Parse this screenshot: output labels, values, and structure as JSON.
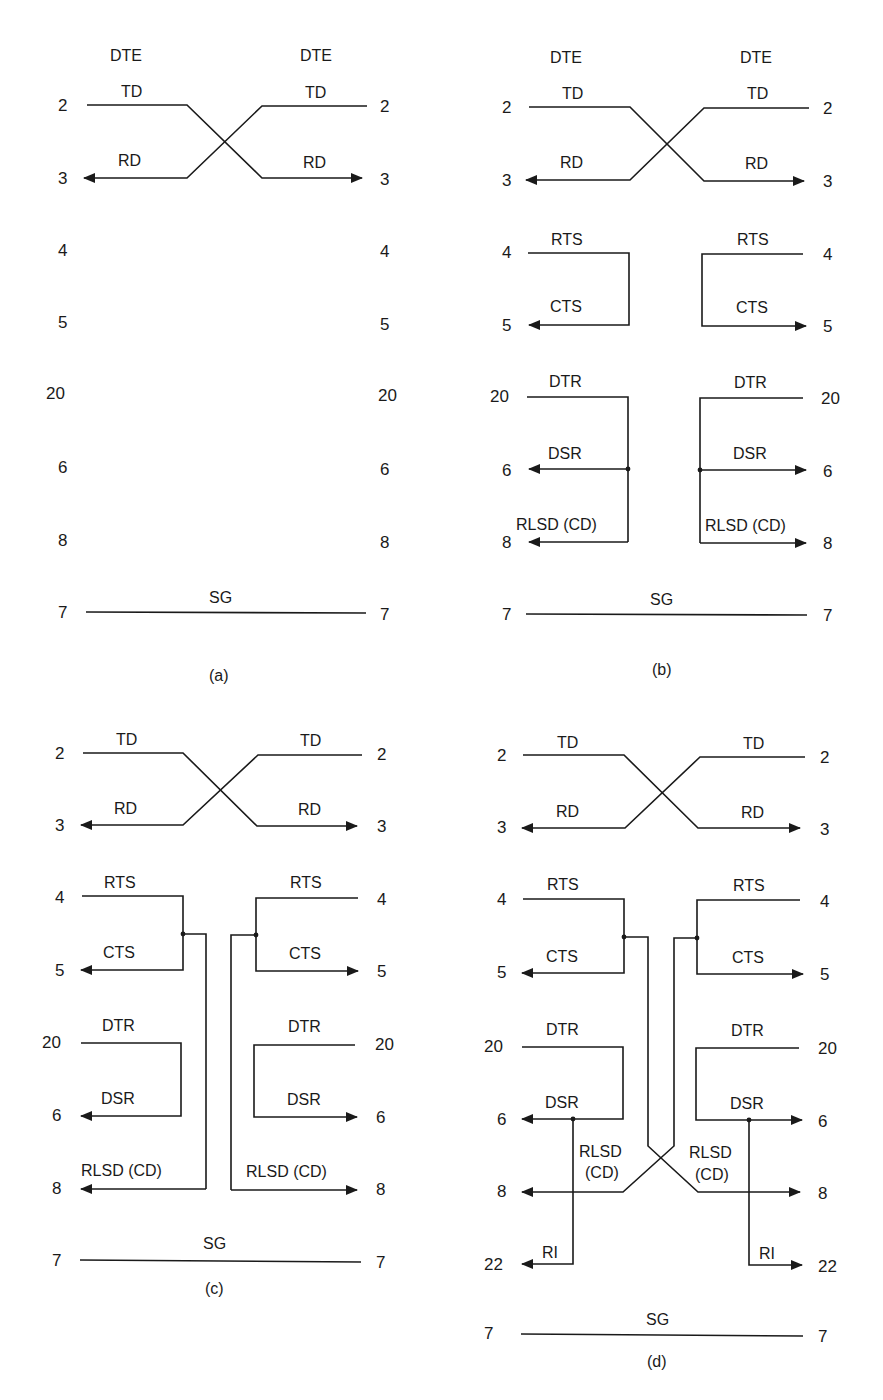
{
  "figure": {
    "panels": [
      {
        "id": "a",
        "caption": "(a)",
        "headers": {
          "left": "DTE",
          "right": "DTE"
        },
        "pins": [
          "2",
          "3",
          "4",
          "5",
          "20",
          "6",
          "8",
          "7"
        ],
        "signals": {
          "td": "TD",
          "rd": "RD",
          "sg": "SG"
        },
        "connections": [
          "TD(2) crossed to RD(3)",
          "SG(7) straight to SG(7)"
        ]
      },
      {
        "id": "b",
        "caption": "(b)",
        "headers": {
          "left": "DTE",
          "right": "DTE"
        },
        "pins": [
          "2",
          "3",
          "4",
          "5",
          "20",
          "6",
          "8",
          "7"
        ],
        "signals": {
          "td": "TD",
          "rd": "RD",
          "rts": "RTS",
          "cts": "CTS",
          "dtr": "DTR",
          "dsr": "DSR",
          "rlsd": "RLSD (CD)",
          "sg": "SG"
        },
        "connections": [
          "TD/RD crossed",
          "RTS looped back to CTS locally",
          "DTR looped back to DSR and RLSD locally",
          "SG straight"
        ]
      },
      {
        "id": "c",
        "caption": "(c)",
        "pins": [
          "2",
          "3",
          "4",
          "5",
          "20",
          "6",
          "8",
          "7"
        ],
        "signals": {
          "td": "TD",
          "rd": "RD",
          "rts": "RTS",
          "cts": "CTS",
          "dtr": "DTR",
          "dsr": "DSR",
          "rlsd": "RLSD (CD)",
          "sg": "SG"
        },
        "connections": [
          "TD/RD crossed",
          "RTS looped to CTS and to remote RLSD",
          "DTR looped to DSR",
          "SG straight"
        ]
      },
      {
        "id": "d",
        "caption": "(d)",
        "pins": [
          "2",
          "3",
          "4",
          "5",
          "20",
          "6",
          "8",
          "22",
          "7"
        ],
        "signals": {
          "td": "TD",
          "rd": "RD",
          "rts": "RTS",
          "cts": "CTS",
          "dtr": "DTR",
          "dsr": "DSR",
          "rlsd_line1": "RLSD",
          "rlsd_line2": "(CD)",
          "ri": "RI",
          "sg": "SG"
        },
        "connections": [
          "TD/RD crossed",
          "RTS looped to CTS and crossed to remote RLSD",
          "DTR looped to DSR and RI",
          "SG straight"
        ]
      }
    ]
  }
}
